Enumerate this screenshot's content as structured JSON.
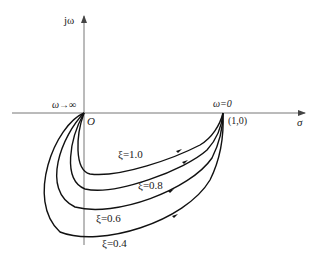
{
  "diagram": {
    "type": "nyquist-plot",
    "axes": {
      "vertical_label": "jω",
      "horizontal_label": "σ",
      "origin_label": "O"
    },
    "annotations": {
      "omega_infinity": "ω→∞",
      "omega_zero": "ω=0",
      "point_one": "(1,0)"
    },
    "curves": [
      {
        "label": "ξ=1.0",
        "damping": 1.0
      },
      {
        "label": "ξ=0.8",
        "damping": 0.8
      },
      {
        "label": "ξ=0.6",
        "damping": 0.6
      },
      {
        "label": "ξ=0.4",
        "damping": 0.4
      }
    ]
  }
}
